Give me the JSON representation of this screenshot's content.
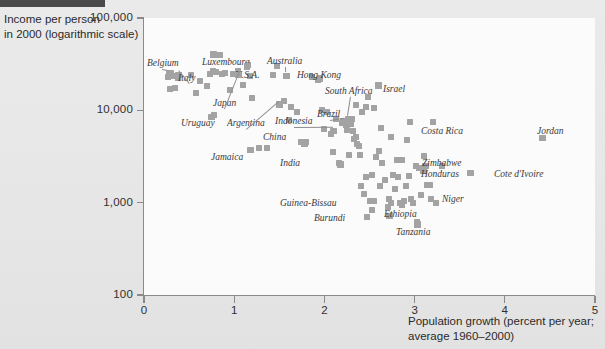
{
  "figure": {
    "y_axis_title": "Income per person\nin 2000 (logarithmic scale)",
    "y_axis_title_line1": "Income per person",
    "y_axis_title_line2": "in 2000 (logarithmic scale)",
    "x_axis_title_line1": "Population growth (percent per year;",
    "x_axis_title_line2": "average 1960–2000)",
    "accent_marker_color": "#a3a3a3",
    "axis_color": "#8a8a8a",
    "background_color": "#e8e8e8",
    "plot_background_color": "#fbfbfb",
    "topbar_color": "#4a4a4a"
  },
  "chart_data": {
    "type": "scatter",
    "title": "",
    "xlabel": "Population growth (percent per year; average 1960–2000)",
    "ylabel": "Income per person in 2000 (logarithmic scale)",
    "xlim": [
      0,
      5
    ],
    "ylim": [
      100,
      100000
    ],
    "yscale": "log",
    "grid": false,
    "legend": false,
    "xticks": [
      "0",
      "1",
      "2",
      "3",
      "4",
      "5"
    ],
    "yticks": [
      "100",
      "1,000",
      "10,000",
      "100,000"
    ],
    "labeled_points": [
      {
        "name": "Belgium",
        "x": 0.28,
        "y": 24500,
        "lx": 3,
        "ly": 40,
        "leader": true
      },
      {
        "name": "Italy",
        "x": 0.38,
        "y": 24000,
        "lx": 34,
        "ly": 55,
        "leader": true
      },
      {
        "name": "Luxembourg",
        "x": 0.77,
        "y": 40000,
        "lx": 58,
        "ly": 39,
        "leader": false
      },
      {
        "name": "U.S.A.",
        "x": 1.14,
        "y": 30000,
        "lx": 91,
        "ly": 52,
        "leader": false
      },
      {
        "name": "Australia",
        "x": 1.58,
        "y": 23500,
        "lx": 123,
        "ly": 38,
        "leader": true
      },
      {
        "name": "Hong Kong",
        "x": 1.95,
        "y": 22000,
        "lx": 153,
        "ly": 52,
        "leader": false
      },
      {
        "name": "South Africa",
        "x": 2.26,
        "y": 8000,
        "lx": 181,
        "ly": 68,
        "leader": true
      },
      {
        "name": "Israel",
        "x": 2.6,
        "y": 18500,
        "lx": 239,
        "ly": 66,
        "leader": false
      },
      {
        "name": "Japan",
        "x": 1.05,
        "y": 24000,
        "lx": 69,
        "ly": 80,
        "leader": true
      },
      {
        "name": "Brazil",
        "x": 2.21,
        "y": 7500,
        "lx": 173,
        "ly": 91,
        "leader": true
      },
      {
        "name": "Uruguay",
        "x": 0.75,
        "y": 8500,
        "lx": 37,
        "ly": 100,
        "leader": false
      },
      {
        "name": "Argentina",
        "x": 1.5,
        "y": 11500,
        "lx": 83,
        "ly": 100,
        "leader": true
      },
      {
        "name": "Indonesia",
        "x": 2.1,
        "y": 6000,
        "lx": 131,
        "ly": 98,
        "leader": true
      },
      {
        "name": "Costa Rica",
        "x": 2.95,
        "y": 7500,
        "lx": 277,
        "ly": 108,
        "leader": false
      },
      {
        "name": "Jordan",
        "x": 4.42,
        "y": 5000,
        "lx": 393,
        "ly": 108,
        "leader": false
      },
      {
        "name": "China",
        "x": 1.78,
        "y": 4400,
        "lx": 119,
        "ly": 114,
        "leader": false
      },
      {
        "name": "Jamaica",
        "x": 1.18,
        "y": 3700,
        "lx": 67,
        "ly": 134,
        "leader": false
      },
      {
        "name": "India",
        "x": 2.18,
        "y": 2600,
        "lx": 136,
        "ly": 140,
        "leader": false
      },
      {
        "name": "Zimbabwe",
        "x": 3.12,
        "y": 2500,
        "lx": 278,
        "ly": 140,
        "leader": false
      },
      {
        "name": "Honduras",
        "x": 3.1,
        "y": 2200,
        "lx": 277,
        "ly": 151,
        "leader": false
      },
      {
        "name": "Cote d'Ivoire",
        "x": 3.62,
        "y": 2100,
        "lx": 350,
        "ly": 151,
        "leader": false
      },
      {
        "name": "Guinea-Bissau",
        "x": 2.53,
        "y": 830,
        "lx": 136,
        "ly": 180,
        "leader": false
      },
      {
        "name": "Niger",
        "x": 3.18,
        "y": 1100,
        "lx": 298,
        "ly": 176,
        "leader": false
      },
      {
        "name": "Burundi",
        "x": 2.47,
        "y": 700,
        "lx": 170,
        "ly": 195,
        "leader": false
      },
      {
        "name": "Ethiopia",
        "x": 2.72,
        "y": 720,
        "lx": 240,
        "ly": 191,
        "leader": false
      },
      {
        "name": "Tanzania",
        "x": 3.03,
        "y": 580,
        "lx": 252,
        "ly": 209,
        "leader": false
      }
    ],
    "points": [
      {
        "x": 0.27,
        "y": 23000
      },
      {
        "x": 0.3,
        "y": 25500
      },
      {
        "x": 0.33,
        "y": 23500
      },
      {
        "x": 0.38,
        "y": 22500
      },
      {
        "x": 0.29,
        "y": 17000
      },
      {
        "x": 0.34,
        "y": 17500
      },
      {
        "x": 0.52,
        "y": 24000
      },
      {
        "x": 0.58,
        "y": 15500
      },
      {
        "x": 0.62,
        "y": 21000
      },
      {
        "x": 0.7,
        "y": 18500
      },
      {
        "x": 0.73,
        "y": 25000
      },
      {
        "x": 0.77,
        "y": 27000
      },
      {
        "x": 0.8,
        "y": 26000
      },
      {
        "x": 0.84,
        "y": 40000
      },
      {
        "x": 0.86,
        "y": 25000
      },
      {
        "x": 0.9,
        "y": 25500
      },
      {
        "x": 0.78,
        "y": 9000
      },
      {
        "x": 0.95,
        "y": 16500
      },
      {
        "x": 0.99,
        "y": 24500
      },
      {
        "x": 1.04,
        "y": 26500
      },
      {
        "x": 1.1,
        "y": 19000
      },
      {
        "x": 1.15,
        "y": 31000
      },
      {
        "x": 1.17,
        "y": 23500
      },
      {
        "x": 1.2,
        "y": 13500
      },
      {
        "x": 1.27,
        "y": 3900
      },
      {
        "x": 1.36,
        "y": 3900
      },
      {
        "x": 1.43,
        "y": 24000
      },
      {
        "x": 1.48,
        "y": 30000
      },
      {
        "x": 1.55,
        "y": 12500
      },
      {
        "x": 1.59,
        "y": 23500
      },
      {
        "x": 1.61,
        "y": 7900
      },
      {
        "x": 1.63,
        "y": 11000
      },
      {
        "x": 1.7,
        "y": 9500
      },
      {
        "x": 1.74,
        "y": 4500
      },
      {
        "x": 1.8,
        "y": 4500
      },
      {
        "x": 1.86,
        "y": 23000
      },
      {
        "x": 1.93,
        "y": 21500
      },
      {
        "x": 1.97,
        "y": 10000
      },
      {
        "x": 2.0,
        "y": 6300
      },
      {
        "x": 2.03,
        "y": 9700
      },
      {
        "x": 2.07,
        "y": 5600
      },
      {
        "x": 2.1,
        "y": 3500
      },
      {
        "x": 2.13,
        "y": 8000
      },
      {
        "x": 2.16,
        "y": 2700
      },
      {
        "x": 2.19,
        "y": 7300
      },
      {
        "x": 2.21,
        "y": 7700
      },
      {
        "x": 2.24,
        "y": 7000
      },
      {
        "x": 2.25,
        "y": 6100
      },
      {
        "x": 2.27,
        "y": 3300
      },
      {
        "x": 2.29,
        "y": 7200
      },
      {
        "x": 2.31,
        "y": 8000
      },
      {
        "x": 2.32,
        "y": 6000
      },
      {
        "x": 2.33,
        "y": 4900
      },
      {
        "x": 2.35,
        "y": 5200
      },
      {
        "x": 2.36,
        "y": 4300
      },
      {
        "x": 2.38,
        "y": 4100
      },
      {
        "x": 2.4,
        "y": 3300
      },
      {
        "x": 2.41,
        "y": 1500
      },
      {
        "x": 2.44,
        "y": 1250
      },
      {
        "x": 2.46,
        "y": 1900
      },
      {
        "x": 2.5,
        "y": 1050
      },
      {
        "x": 2.53,
        "y": 2000
      },
      {
        "x": 2.55,
        "y": 1050
      },
      {
        "x": 2.57,
        "y": 3100
      },
      {
        "x": 2.6,
        "y": 3600
      },
      {
        "x": 2.62,
        "y": 1500
      },
      {
        "x": 2.48,
        "y": 14000
      },
      {
        "x": 2.46,
        "y": 11000
      },
      {
        "x": 2.55,
        "y": 10500
      },
      {
        "x": 2.64,
        "y": 2700
      },
      {
        "x": 2.67,
        "y": 1750
      },
      {
        "x": 2.7,
        "y": 900
      },
      {
        "x": 2.72,
        "y": 1100
      },
      {
        "x": 2.74,
        "y": 1000
      },
      {
        "x": 2.76,
        "y": 2000
      },
      {
        "x": 2.78,
        "y": 1400
      },
      {
        "x": 2.8,
        "y": 2900
      },
      {
        "x": 2.82,
        "y": 1900
      },
      {
        "x": 2.84,
        "y": 1000
      },
      {
        "x": 2.86,
        "y": 950
      },
      {
        "x": 2.88,
        "y": 1050
      },
      {
        "x": 2.9,
        "y": 1500
      },
      {
        "x": 2.92,
        "y": 4800
      },
      {
        "x": 2.94,
        "y": 1950
      },
      {
        "x": 2.96,
        "y": 1100
      },
      {
        "x": 2.98,
        "y": 1000
      },
      {
        "x": 3.01,
        "y": 2500
      },
      {
        "x": 3.03,
        "y": 620
      },
      {
        "x": 3.05,
        "y": 2400
      },
      {
        "x": 3.07,
        "y": 1200
      },
      {
        "x": 3.1,
        "y": 3200
      },
      {
        "x": 3.14,
        "y": 1550
      },
      {
        "x": 3.17,
        "y": 1560
      },
      {
        "x": 3.2,
        "y": 7400
      },
      {
        "x": 3.24,
        "y": 1000
      },
      {
        "x": 3.3,
        "y": 2500
      },
      {
        "x": 2.86,
        "y": 2900
      },
      {
        "x": 2.63,
        "y": 6500
      },
      {
        "x": 2.74,
        "y": 5200
      },
      {
        "x": 2.42,
        "y": 9600
      },
      {
        "x": 2.35,
        "y": 11500
      }
    ]
  }
}
